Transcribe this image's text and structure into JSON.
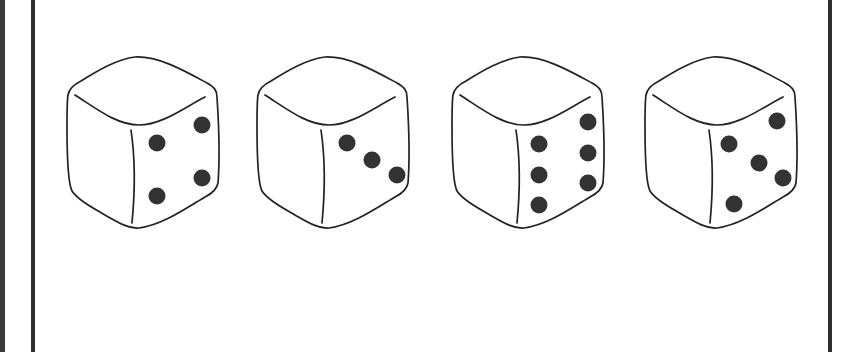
{
  "figure": {
    "description": "Four dice shown in perspective, each with the right face visible showing pips",
    "colors": {
      "background": "#ffffff",
      "outline": "#222222",
      "pip": "#333333",
      "frame": "#2e2e2e"
    },
    "dice": [
      {
        "label": "die 1",
        "right_face_pips": 4,
        "offset_x": 67,
        "pips": [
          [
            90,
            86
          ],
          [
            135,
            68
          ],
          [
            135,
            121
          ],
          [
            90,
            139
          ]
        ]
      },
      {
        "label": "die 2",
        "right_face_pips": 3,
        "offset_x": 257,
        "pips": [
          [
            90,
            86
          ],
          [
            115,
            103
          ],
          [
            140,
            118
          ]
        ]
      },
      {
        "label": "die 3",
        "right_face_pips": 6,
        "offset_x": 452,
        "pips": [
          [
            87,
            87
          ],
          [
            87,
            118
          ],
          [
            87,
            148
          ],
          [
            136,
            65
          ],
          [
            136,
            96
          ],
          [
            136,
            126
          ]
        ]
      },
      {
        "label": "die 4",
        "right_face_pips": 5,
        "offset_x": 645,
        "pips": [
          [
            84,
            87
          ],
          [
            132,
            64
          ],
          [
            114,
            106
          ],
          [
            138,
            121
          ],
          [
            89,
            147
          ]
        ]
      }
    ]
  }
}
